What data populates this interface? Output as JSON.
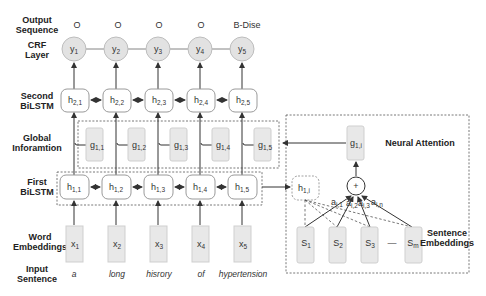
{
  "row_labels": {
    "output_sequence": [
      "Output",
      "Sequence"
    ],
    "crf_layer": [
      "CRF",
      "Layer"
    ],
    "second_bilstm": [
      "Second",
      "BiLSTM"
    ],
    "global_information": [
      "Global",
      "Inforamtion"
    ],
    "first_bilstm": [
      "First",
      "BiLSTM"
    ],
    "word_embeddings": [
      "Word",
      "Embeddings"
    ],
    "input_sentence": [
      "Input",
      "Sentence"
    ]
  },
  "output_tags": [
    "O",
    "O",
    "O",
    "O",
    "B-Dise"
  ],
  "crf_nodes": [
    {
      "base": "y",
      "sub": "1"
    },
    {
      "base": "y",
      "sub": "2"
    },
    {
      "base": "y",
      "sub": "3"
    },
    {
      "base": "y",
      "sub": "4"
    },
    {
      "base": "y",
      "sub": "5"
    }
  ],
  "second_bilstm_nodes": [
    {
      "base": "h",
      "sub": "2,1"
    },
    {
      "base": "h",
      "sub": "2,2"
    },
    {
      "base": "h",
      "sub": "2,3"
    },
    {
      "base": "h",
      "sub": "2,4"
    },
    {
      "base": "h",
      "sub": "2,5"
    }
  ],
  "global_nodes": [
    {
      "base": "g",
      "sub": "1,1"
    },
    {
      "base": "g",
      "sub": "1,2"
    },
    {
      "base": "g",
      "sub": "1,3"
    },
    {
      "base": "g",
      "sub": "1,4"
    },
    {
      "base": "g",
      "sub": "1,5"
    }
  ],
  "first_bilstm_nodes": [
    {
      "base": "h",
      "sub": "1,1"
    },
    {
      "base": "h",
      "sub": "1,2"
    },
    {
      "base": "h",
      "sub": "1,3"
    },
    {
      "base": "h",
      "sub": "1,4"
    },
    {
      "base": "h",
      "sub": "1,5"
    }
  ],
  "word_embedding_nodes": [
    {
      "base": "x",
      "sub": "1"
    },
    {
      "base": "x",
      "sub": "2"
    },
    {
      "base": "x",
      "sub": "3"
    },
    {
      "base": "x",
      "sub": "4"
    },
    {
      "base": "x",
      "sub": "5"
    }
  ],
  "input_words": [
    "a",
    "long",
    "hisrory",
    "of",
    "hypertension"
  ],
  "neural_attention": {
    "title": "Neural Attention",
    "output_node": {
      "base": "g",
      "sub": "1,i"
    },
    "query_node": {
      "base": "h",
      "sub": "1,i"
    },
    "sum_symbol": "+",
    "weights": [
      {
        "base": "a",
        "sub": "i,1"
      },
      {
        "base": "a",
        "sub": "i,2"
      },
      {
        "base": "a",
        "sub": "i,3"
      },
      {
        "base": "a",
        "sub": "i,n"
      }
    ],
    "sentence_nodes": [
      {
        "base": "S",
        "sub": "1"
      },
      {
        "base": "S",
        "sub": "2"
      },
      {
        "base": "S",
        "sub": "3"
      },
      {
        "base": "S",
        "sub": "m"
      }
    ],
    "ellipsis": "—",
    "sentence_label": [
      "Sentence",
      "Embeddings"
    ]
  }
}
